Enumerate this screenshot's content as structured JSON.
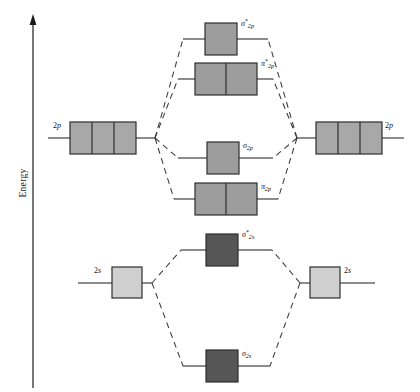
{
  "diagram": {
    "axis": {
      "label": "Energy",
      "direction": "up"
    },
    "colors": {
      "mo_box_2p": "#9d9d9d",
      "mo_box_2s": "#565656",
      "ao_box_2p": "#a8a8a8",
      "ao_box_2s": "#cfcfcf",
      "box_border": "#2e2e2e",
      "line": "#1a1a1a",
      "dashed": "#3a3a3a",
      "text": "#111111"
    },
    "atomic_orbitals": [
      {
        "id": "ao-left-2p",
        "label": "2p",
        "symbol": "2",
        "subshell": "p",
        "side": "left",
        "boxes": 3,
        "energy_y": 138,
        "shade": "#a8a8a8"
      },
      {
        "id": "ao-right-2p",
        "label": "2p",
        "symbol": "2",
        "subshell": "p",
        "side": "right",
        "boxes": 3,
        "energy_y": 138,
        "shade": "#a8a8a8"
      },
      {
        "id": "ao-left-2s",
        "label": "2s",
        "symbol": "2",
        "subshell": "s",
        "side": "left",
        "boxes": 1,
        "energy_y": 283,
        "shade": "#cfcfcf"
      },
      {
        "id": "ao-right-2s",
        "label": "2s",
        "symbol": "2",
        "subshell": "s",
        "side": "right",
        "boxes": 1,
        "energy_y": 283,
        "shade": "#cfcfcf"
      }
    ],
    "molecular_orbitals": [
      {
        "id": "mo-sigma-star-2p",
        "label": "σ*2p",
        "greek": "σ",
        "star": "*",
        "sub": "2p",
        "boxes": 1,
        "energy_y": 39,
        "shade": "#9d9d9d",
        "type": "antibonding"
      },
      {
        "id": "mo-pi-star-2p",
        "label": "π*2p",
        "greek": "π",
        "star": "*",
        "sub": "2p",
        "boxes": 2,
        "energy_y": 79,
        "shade": "#9d9d9d",
        "type": "antibonding"
      },
      {
        "id": "mo-sigma-2p",
        "label": "σ2p",
        "greek": "σ",
        "star": "",
        "sub": "2p",
        "boxes": 1,
        "energy_y": 158,
        "shade": "#9d9d9d",
        "type": "bonding"
      },
      {
        "id": "mo-pi-2p",
        "label": "π2p",
        "greek": "π",
        "star": "",
        "sub": "2p",
        "boxes": 2,
        "energy_y": 199,
        "shade": "#9d9d9d",
        "type": "bonding"
      },
      {
        "id": "mo-sigma-star-2s",
        "label": "σ*2s",
        "greek": "σ",
        "star": "*",
        "sub": "2s",
        "boxes": 1,
        "energy_y": 250,
        "shade": "#565656",
        "type": "antibonding"
      },
      {
        "id": "mo-sigma-2s",
        "label": "σ2s",
        "greek": "σ",
        "star": "",
        "sub": "2s",
        "boxes": 1,
        "energy_y": 366,
        "shade": "#565656",
        "type": "bonding"
      }
    ],
    "labels": {
      "sigma_star_2p": "σ",
      "pi_star_2p": "π",
      "sigma_2p": "σ",
      "pi_2p": "π",
      "sigma_star_2s": "σ",
      "sigma_2s": "σ",
      "star_glyph": "*",
      "sub_2p": "2p",
      "sub_2s": "2s",
      "ao_2p": "2",
      "ao_2p_sub": "p",
      "ao_2s": "2",
      "ao_2s_sub": "s"
    }
  }
}
